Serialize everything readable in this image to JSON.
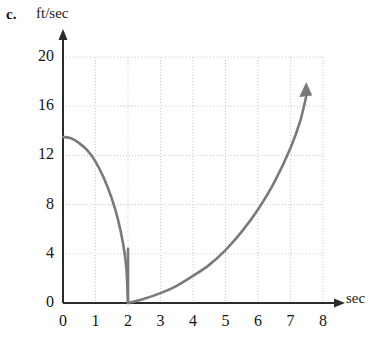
{
  "figure": {
    "part_label": "c.",
    "y_axis_unit": "ft/sec",
    "x_axis_unit": "sec"
  },
  "chart_data": {
    "type": "line",
    "title": "",
    "subtitle": "",
    "xlabel": "sec",
    "ylabel": "ft/sec",
    "xlim": [
      0,
      8
    ],
    "ylim": [
      0,
      20
    ],
    "xticks": [
      0,
      1,
      2,
      3,
      4,
      5,
      6,
      7,
      8
    ],
    "yticks": [
      0,
      4,
      8,
      12,
      16,
      20
    ],
    "xtick_labels": [
      "0",
      "1",
      "2",
      "3",
      "4",
      "5",
      "6",
      "7",
      "8"
    ],
    "ytick_labels": [
      "0",
      "4",
      "8",
      "12",
      "16",
      "20"
    ],
    "grid": true,
    "grid_style": "dotted",
    "grid_color": "#c9c9c9",
    "legend": null,
    "axis_arrows": {
      "x": true,
      "y": true
    },
    "curve_color": "#7a7a7a",
    "curve_width": 2.6,
    "series": [
      {
        "name": "descending-branch",
        "comment": "velocity decreasing from about 13.5 ft/sec at t=0 to 0 ft/sec at t=2",
        "x": [
          0,
          0.25,
          0.5,
          0.75,
          1.0,
          1.25,
          1.5,
          1.7,
          1.85,
          1.95,
          2.0
        ],
        "values": [
          13.5,
          13.4,
          13.0,
          12.4,
          11.5,
          10.2,
          8.5,
          6.7,
          4.8,
          2.8,
          0
        ]
      },
      {
        "name": "ascending-branch",
        "comment": "velocity increasing from 0 ft/sec at t=2 to about 17 ft/sec at t=7.5, arrowhead at end",
        "x": [
          2.0,
          2.5,
          3.0,
          3.5,
          4.0,
          4.5,
          5.0,
          5.5,
          6.0,
          6.5,
          7.0,
          7.3,
          7.5
        ],
        "values": [
          0,
          0.35,
          0.8,
          1.4,
          2.2,
          3.1,
          4.3,
          5.8,
          7.6,
          9.8,
          12.6,
          14.8,
          17.0
        ],
        "end_marker": "arrow-up"
      }
    ],
    "annotations": [
      {
        "name": "drop-line",
        "type": "vertical-segment",
        "x": 2.0,
        "y_from": 0,
        "y_to": 4.4
      }
    ]
  }
}
